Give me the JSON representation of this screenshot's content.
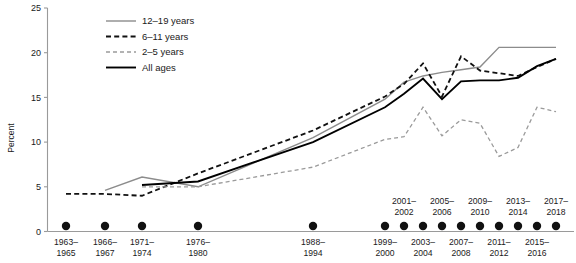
{
  "chart_data": {
    "type": "line",
    "title": "",
    "xlabel": "",
    "ylabel": "Percent",
    "ylim": [
      0,
      25
    ],
    "yticks": [
      0,
      5,
      10,
      15,
      20,
      25
    ],
    "ytick_labels": [
      "0",
      "5",
      "10",
      "15",
      "20",
      "25"
    ],
    "grid": false,
    "legend_position": "top-left",
    "categories": [
      "1963–1965",
      "1966–1967",
      "1971–1974",
      "1976–1980",
      "1988–1994",
      "1999–2000",
      "2001–2002",
      "2003–2004",
      "2005–2006",
      "2007–2008",
      "2009–2010",
      "2011–2012",
      "2013–2014",
      "2015–2016",
      "2017–2018"
    ],
    "category_lines": [
      [
        "1963–",
        "1965"
      ],
      [
        "1966–",
        "1967"
      ],
      [
        "1971–",
        "1974"
      ],
      [
        "1976–",
        "1980"
      ],
      [
        "1988–",
        "1994"
      ],
      [
        "1999–",
        "2000"
      ],
      [
        "2001–",
        "2002"
      ],
      [
        "2003–",
        "2004"
      ],
      [
        "2005–",
        "2006"
      ],
      [
        "2007–",
        "2008"
      ],
      [
        "2009–",
        "2010"
      ],
      [
        "2011–",
        "2012"
      ],
      [
        "2013–",
        "2014"
      ],
      [
        "2015–",
        "2016"
      ],
      [
        "2017–",
        "2018"
      ]
    ],
    "category_label_placement": [
      "below",
      "below",
      "below",
      "below",
      "below",
      "below",
      "above",
      "below",
      "above",
      "below",
      "above",
      "below",
      "above",
      "below",
      "above"
    ],
    "series": [
      {
        "name": "12–19 years",
        "style": "solid-gray",
        "color": "#8c8c8c",
        "values": [
          null,
          4.6,
          6.1,
          5.0,
          10.5,
          14.8,
          16.7,
          17.4,
          17.8,
          18.1,
          18.4,
          20.6,
          20.6,
          20.6,
          20.6
        ]
      },
      {
        "name": "6–11 years",
        "style": "dashed-black",
        "color": "#111111",
        "values": [
          4.2,
          4.2,
          4.0,
          6.5,
          11.3,
          15.1,
          16.5,
          18.8,
          15.1,
          19.6,
          18.0,
          17.7,
          17.4,
          18.4,
          19.3
        ]
      },
      {
        "name": "2–5 years",
        "style": "dashed-gray",
        "color": "#9a9a9a",
        "values": [
          null,
          null,
          5.0,
          5.0,
          7.2,
          10.3,
          10.6,
          13.9,
          10.7,
          12.5,
          12.1,
          8.4,
          9.4,
          13.9,
          13.4
        ]
      },
      {
        "name": "All ages",
        "style": "solid-black",
        "color": "#000000",
        "values": [
          null,
          null,
          5.2,
          5.6,
          10.0,
          13.9,
          15.4,
          17.1,
          14.8,
          16.8,
          16.9,
          16.9,
          17.2,
          18.5,
          19.3
        ]
      }
    ],
    "marker_dots": true,
    "marker_dot_count": 15,
    "annotations": []
  },
  "legend": {
    "items": [
      {
        "label": "12–19 years",
        "swatch": "solid-gray"
      },
      {
        "label": "6–11 years",
        "swatch": "dashed-black"
      },
      {
        "label": "2–5 years",
        "swatch": "dashed-gray"
      },
      {
        "label": "All ages",
        "swatch": "solid-black"
      }
    ]
  },
  "axes": {
    "y_title": "Percent"
  },
  "colors": {
    "axis": "#9a9a9a",
    "text": "#1a1a1a",
    "series_gray_solid": "#8c8c8c",
    "series_black_dashed": "#111111",
    "series_gray_dashed": "#9a9a9a",
    "series_black_solid": "#000000",
    "marker": "#111111",
    "background": "#ffffff"
  }
}
